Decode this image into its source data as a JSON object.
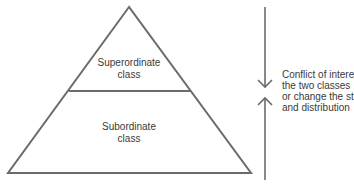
{
  "diagram": {
    "type": "class-pyramid",
    "tiers": [
      {
        "id": "top",
        "label_line1": "Superordinate",
        "label_line2": "class"
      },
      {
        "id": "bottom",
        "label_line1": "Subordinate",
        "label_line2": "class"
      }
    ],
    "annotation": {
      "lines": [
        "Conflict of intere",
        "the two classes",
        "or change the st",
        "and distribution"
      ]
    },
    "colors": {
      "stroke": "#6b6b6b",
      "text": "#3a3a3a",
      "background": "#ffffff"
    }
  }
}
